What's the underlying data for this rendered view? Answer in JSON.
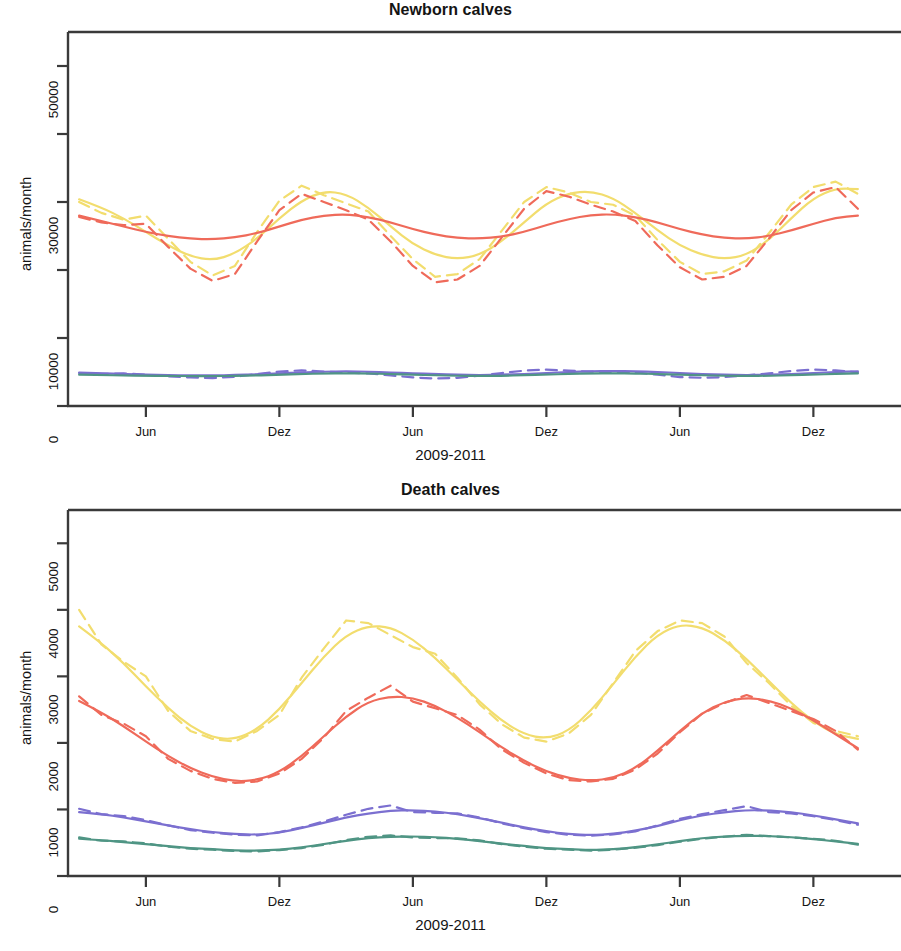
{
  "figure": {
    "axis_title_y": "animals/month",
    "axis_title_x": "2009-2011",
    "frame_color": "#3a3a3a"
  },
  "colors": {
    "yellow": "#f2dd6e",
    "red": "#ef6a5a",
    "blue": "#7b6fd0",
    "green": "#4f9584"
  },
  "chart_data": [
    {
      "type": "line",
      "id": "newborn-calves",
      "title": "Newborn calves",
      "xlabel": "2009-2011",
      "ylabel": "animals/month",
      "ylim": [
        0,
        55000
      ],
      "yticks": [
        0,
        10000,
        20000,
        30000,
        40000,
        50000
      ],
      "ytick_labels": [
        "0",
        "10000",
        "",
        "30000",
        "",
        "50000"
      ],
      "xticks": [
        6,
        12,
        18,
        24,
        30,
        36
      ],
      "xtick_labels": [
        "Jun",
        "Dez",
        "Jun",
        "Dez",
        "Jun",
        "Dez"
      ],
      "xlim": [
        2.5,
        38.5
      ],
      "grid": false,
      "legend": "none",
      "x": [
        3,
        4,
        5,
        6,
        7,
        8,
        9,
        10,
        11,
        12,
        13,
        14,
        15,
        16,
        17,
        18,
        19,
        20,
        21,
        22,
        23,
        24,
        25,
        26,
        27,
        28,
        29,
        30,
        31,
        32,
        33,
        34,
        35,
        36,
        37,
        38
      ],
      "series": [
        {
          "name": "yellow-solid",
          "color": "#f2dd6e",
          "style": "solid",
          "values": [
            30400,
            29200,
            27600,
            25600,
            23600,
            22000,
            21400,
            22400,
            24600,
            27600,
            30200,
            31600,
            31200,
            29200,
            26400,
            23800,
            22200,
            21600,
            22200,
            24200,
            27000,
            29800,
            31300,
            31600,
            30600,
            28400,
            25800,
            23600,
            22200,
            21600,
            22200,
            24400,
            27600,
            30600,
            32000,
            31900
          ]
        },
        {
          "name": "yellow-dashed",
          "color": "#f2dd6e",
          "style": "dashed",
          "values": [
            30000,
            28400,
            27400,
            28000,
            24600,
            21200,
            19200,
            20600,
            25600,
            30200,
            32400,
            31000,
            29800,
            28600,
            25000,
            21600,
            19000,
            19400,
            21600,
            25800,
            30000,
            32200,
            31400,
            30000,
            29600,
            28000,
            24400,
            21200,
            19400,
            19800,
            21400,
            25400,
            29600,
            32200,
            33000,
            31200
          ]
        },
        {
          "name": "red-solid",
          "color": "#ef6a5a",
          "style": "solid",
          "values": [
            28000,
            27200,
            26400,
            25600,
            25000,
            24600,
            24500,
            24800,
            25400,
            26400,
            27400,
            28000,
            28200,
            27800,
            27000,
            26000,
            25200,
            24700,
            24600,
            24900,
            25600,
            26600,
            27500,
            28100,
            28200,
            27800,
            27000,
            26000,
            25200,
            24700,
            24600,
            25000,
            25800,
            26800,
            27700,
            28000
          ]
        },
        {
          "name": "red-dashed",
          "color": "#ef6a5a",
          "style": "dashed",
          "values": [
            27800,
            27000,
            26600,
            26800,
            23400,
            20200,
            18400,
            19400,
            24200,
            28800,
            31200,
            30000,
            28800,
            27400,
            24200,
            20600,
            18200,
            18600,
            20600,
            24800,
            29000,
            31600,
            30800,
            29600,
            28600,
            27200,
            23600,
            20400,
            18600,
            19000,
            20600,
            24600,
            28800,
            31400,
            32200,
            29000
          ]
        },
        {
          "name": "blue-solid",
          "color": "#7b6fd0",
          "style": "solid",
          "values": [
            4900,
            4800,
            4700,
            4600,
            4550,
            4500,
            4500,
            4550,
            4650,
            4800,
            4950,
            5050,
            5100,
            5050,
            4950,
            4800,
            4700,
            4600,
            4550,
            4600,
            4700,
            4850,
            5000,
            5100,
            5150,
            5100,
            5000,
            4850,
            4700,
            4600,
            4550,
            4600,
            4700,
            4850,
            5000,
            5100
          ]
        },
        {
          "name": "blue-dashed",
          "color": "#7b6fd0",
          "style": "dashed",
          "values": [
            4850,
            4700,
            4800,
            4600,
            4350,
            4200,
            4100,
            4300,
            4700,
            5050,
            5250,
            5050,
            4900,
            4800,
            4500,
            4200,
            4050,
            4150,
            4450,
            4850,
            5200,
            5350,
            5200,
            5050,
            5000,
            4950,
            4600,
            4250,
            4150,
            4250,
            4500,
            4800,
            5150,
            5350,
            5250,
            4950
          ]
        },
        {
          "name": "green-solid",
          "color": "#4f9584",
          "style": "solid",
          "values": [
            4600,
            4550,
            4500,
            4450,
            4420,
            4400,
            4400,
            4430,
            4500,
            4600,
            4700,
            4780,
            4800,
            4780,
            4700,
            4600,
            4520,
            4450,
            4420,
            4450,
            4520,
            4620,
            4720,
            4790,
            4810,
            4780,
            4700,
            4600,
            4520,
            4450,
            4420,
            4450,
            4520,
            4620,
            4720,
            4790
          ]
        }
      ]
    },
    {
      "type": "line",
      "id": "death-calves",
      "title": "Death calves",
      "xlabel": "2009-2011",
      "ylabel": "animals/month",
      "ylim": [
        0,
        5500
      ],
      "yticks": [
        0,
        1000,
        2000,
        3000,
        4000,
        5000
      ],
      "ytick_labels": [
        "0",
        "1000",
        "2000",
        "3000",
        "4000",
        "5000"
      ],
      "xticks": [
        6,
        12,
        18,
        24,
        30,
        36
      ],
      "xtick_labels": [
        "Jun",
        "Dez",
        "Jun",
        "Dez",
        "Jun",
        "Dez"
      ],
      "xlim": [
        2.5,
        38.5
      ],
      "grid": false,
      "legend": "none",
      "x": [
        3,
        4,
        5,
        6,
        7,
        8,
        9,
        10,
        11,
        12,
        13,
        14,
        15,
        16,
        17,
        18,
        19,
        20,
        21,
        22,
        23,
        24,
        25,
        26,
        27,
        28,
        29,
        30,
        31,
        32,
        33,
        34,
        35,
        36,
        37,
        38
      ],
      "series": [
        {
          "name": "yellow-solid",
          "color": "#f2dd6e",
          "style": "solid",
          "values": [
            3750,
            3500,
            3200,
            2850,
            2520,
            2250,
            2080,
            2050,
            2200,
            2500,
            2900,
            3300,
            3620,
            3760,
            3740,
            3560,
            3280,
            2950,
            2620,
            2330,
            2130,
            2060,
            2180,
            2480,
            2880,
            3300,
            3630,
            3780,
            3740,
            3550,
            3260,
            2930,
            2600,
            2320,
            2130,
            2060
          ]
        },
        {
          "name": "yellow-dashed",
          "color": "#f2dd6e",
          "style": "dashed",
          "values": [
            4000,
            3480,
            3220,
            3000,
            2480,
            2180,
            2060,
            2020,
            2180,
            2420,
            2980,
            3420,
            3840,
            3800,
            3620,
            3440,
            3340,
            2980,
            2580,
            2280,
            2080,
            2020,
            2140,
            2420,
            2900,
            3380,
            3680,
            3840,
            3800,
            3600,
            3200,
            2900,
            2560,
            2300,
            2180,
            2100
          ]
        },
        {
          "name": "red-solid",
          "color": "#ef6a5a",
          "style": "solid",
          "values": [
            2630,
            2460,
            2250,
            2020,
            1800,
            1620,
            1490,
            1420,
            1440,
            1560,
            1800,
            2100,
            2400,
            2620,
            2700,
            2680,
            2560,
            2380,
            2160,
            1930,
            1730,
            1570,
            1470,
            1430,
            1470,
            1620,
            1880,
            2180,
            2450,
            2620,
            2680,
            2640,
            2520,
            2340,
            2130,
            1920
          ]
        },
        {
          "name": "red-dashed",
          "color": "#ef6a5a",
          "style": "dashed",
          "values": [
            2700,
            2420,
            2290,
            2100,
            1760,
            1580,
            1460,
            1400,
            1420,
            1540,
            1760,
            2080,
            2480,
            2680,
            2860,
            2620,
            2520,
            2420,
            2200,
            1900,
            1700,
            1540,
            1440,
            1420,
            1460,
            1600,
            1840,
            2160,
            2440,
            2600,
            2720,
            2600,
            2480,
            2360,
            2180,
            1900
          ]
        },
        {
          "name": "blue-solid",
          "color": "#7b6fd0",
          "style": "solid",
          "values": [
            960,
            930,
            880,
            820,
            760,
            700,
            660,
            630,
            620,
            650,
            720,
            800,
            880,
            940,
            980,
            990,
            970,
            930,
            870,
            800,
            730,
            670,
            630,
            615,
            630,
            680,
            750,
            840,
            910,
            960,
            990,
            985,
            960,
            910,
            850,
            790
          ]
        },
        {
          "name": "blue-dashed",
          "color": "#7b6fd0",
          "style": "dashed",
          "values": [
            1010,
            930,
            900,
            840,
            760,
            690,
            650,
            620,
            610,
            660,
            730,
            820,
            920,
            1010,
            1060,
            960,
            950,
            940,
            880,
            790,
            720,
            660,
            620,
            605,
            625,
            670,
            760,
            860,
            930,
            990,
            1050,
            960,
            940,
            900,
            840,
            770
          ]
        },
        {
          "name": "green-solid",
          "color": "#4f9584",
          "style": "solid",
          "values": [
            560,
            540,
            510,
            480,
            450,
            420,
            400,
            385,
            380,
            395,
            430,
            480,
            530,
            570,
            590,
            595,
            585,
            560,
            525,
            485,
            450,
            420,
            400,
            390,
            400,
            430,
            475,
            525,
            570,
            595,
            605,
            600,
            585,
            555,
            520,
            485
          ]
        },
        {
          "name": "green-dashed",
          "color": "#4f9584",
          "style": "dashed",
          "values": [
            580,
            530,
            520,
            490,
            440,
            410,
            395,
            375,
            370,
            390,
            420,
            470,
            540,
            590,
            610,
            580,
            570,
            565,
            535,
            480,
            440,
            410,
            395,
            380,
            395,
            425,
            465,
            515,
            560,
            590,
            620,
            600,
            580,
            560,
            530,
            470
          ]
        }
      ]
    }
  ]
}
